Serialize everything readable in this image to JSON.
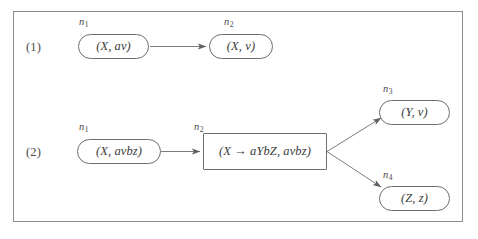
{
  "figure": {
    "background_color": "#ffffff",
    "ink_color": "#3a3a3a",
    "line_color": "#6e6e6e",
    "frame_color": "#8d8d8d"
  },
  "rows": [
    {
      "marker": "(1)"
    },
    {
      "marker": "(2)"
    }
  ],
  "nodes": [
    {
      "id": "r1-n1",
      "label": "n",
      "label_sub": "1",
      "text": "(X, av)",
      "shape": "stadium",
      "row": 1
    },
    {
      "id": "r1-n2",
      "label": "n",
      "label_sub": "2",
      "text": "(X, v)",
      "shape": "stadium",
      "row": 1
    },
    {
      "id": "r2-n1",
      "label": "n",
      "label_sub": "1",
      "text": "(X, avbz)",
      "shape": "stadium",
      "row": 2
    },
    {
      "id": "r2-n2",
      "label": "n",
      "label_sub": "2",
      "text": "(X → aYbZ, avbz)",
      "shape": "rectangle",
      "row": 2
    },
    {
      "id": "r2-n3",
      "label": "n",
      "label_sub": "3",
      "text": "(Y, v)",
      "shape": "stadium",
      "row": 2
    },
    {
      "id": "r2-n4",
      "label": "n",
      "label_sub": "4",
      "text": "(Z, z)",
      "shape": "stadium",
      "row": 2
    }
  ],
  "edges": [
    {
      "from": "r1-n1",
      "to": "r1-n2",
      "style": "arrow"
    },
    {
      "from": "r2-n1",
      "to": "r2-n2",
      "style": "arrow"
    },
    {
      "from": "r2-n2",
      "to": "r2-n3",
      "style": "arrow"
    },
    {
      "from": "r2-n2",
      "to": "r2-n4",
      "style": "arrow"
    }
  ]
}
